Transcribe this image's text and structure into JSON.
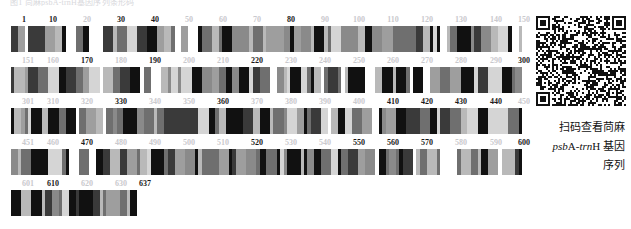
{
  "figure": {
    "top_caption": "图1 苘麻psbA-trnH基因序列条形码",
    "sequence_length": 637,
    "bases_per_row": 150,
    "rows": [
      {
        "start": 1,
        "end": 150,
        "ticks": [
          {
            "value": "1",
            "pos": 1,
            "bold": true
          },
          {
            "value": "10",
            "pos": 10,
            "bold": true
          },
          {
            "value": "20",
            "pos": 20,
            "bold": false
          },
          {
            "value": "30",
            "pos": 30,
            "bold": true
          },
          {
            "value": "40",
            "pos": 40,
            "bold": true
          },
          {
            "value": "50",
            "pos": 50,
            "bold": false
          },
          {
            "value": "60",
            "pos": 60,
            "bold": false
          },
          {
            "value": "70",
            "pos": 70,
            "bold": false
          },
          {
            "value": "80",
            "pos": 80,
            "bold": true
          },
          {
            "value": "90",
            "pos": 90,
            "bold": false
          },
          {
            "value": "100",
            "pos": 100,
            "bold": false
          },
          {
            "value": "110",
            "pos": 110,
            "bold": false
          },
          {
            "value": "120",
            "pos": 120,
            "bold": false
          },
          {
            "value": "130",
            "pos": 130,
            "bold": false
          },
          {
            "value": "140",
            "pos": 140,
            "bold": false
          },
          {
            "value": "150",
            "pos": 150,
            "bold": false
          }
        ]
      },
      {
        "start": 151,
        "end": 300,
        "ticks": [
          {
            "value": "151",
            "pos": 151,
            "bold": false
          },
          {
            "value": "160",
            "pos": 160,
            "bold": false
          },
          {
            "value": "170",
            "pos": 170,
            "bold": true
          },
          {
            "value": "180",
            "pos": 180,
            "bold": false
          },
          {
            "value": "190",
            "pos": 190,
            "bold": true
          },
          {
            "value": "200",
            "pos": 200,
            "bold": false
          },
          {
            "value": "210",
            "pos": 210,
            "bold": false
          },
          {
            "value": "220",
            "pos": 220,
            "bold": true
          },
          {
            "value": "230",
            "pos": 230,
            "bold": false
          },
          {
            "value": "240",
            "pos": 240,
            "bold": false
          },
          {
            "value": "250",
            "pos": 250,
            "bold": false
          },
          {
            "value": "260",
            "pos": 260,
            "bold": false
          },
          {
            "value": "270",
            "pos": 270,
            "bold": false
          },
          {
            "value": "280",
            "pos": 280,
            "bold": false
          },
          {
            "value": "290",
            "pos": 290,
            "bold": false
          },
          {
            "value": "300",
            "pos": 300,
            "bold": true
          }
        ]
      },
      {
        "start": 301,
        "end": 450,
        "ticks": [
          {
            "value": "301",
            "pos": 301,
            "bold": false
          },
          {
            "value": "310",
            "pos": 310,
            "bold": false
          },
          {
            "value": "320",
            "pos": 320,
            "bold": false
          },
          {
            "value": "330",
            "pos": 330,
            "bold": true
          },
          {
            "value": "340",
            "pos": 340,
            "bold": false
          },
          {
            "value": "350",
            "pos": 350,
            "bold": false
          },
          {
            "value": "360",
            "pos": 360,
            "bold": true
          },
          {
            "value": "370",
            "pos": 370,
            "bold": false
          },
          {
            "value": "380",
            "pos": 380,
            "bold": false
          },
          {
            "value": "390",
            "pos": 390,
            "bold": false
          },
          {
            "value": "400",
            "pos": 400,
            "bold": false
          },
          {
            "value": "410",
            "pos": 410,
            "bold": true
          },
          {
            "value": "420",
            "pos": 420,
            "bold": true
          },
          {
            "value": "430",
            "pos": 430,
            "bold": true
          },
          {
            "value": "440",
            "pos": 440,
            "bold": true
          },
          {
            "value": "450",
            "pos": 450,
            "bold": false
          }
        ]
      },
      {
        "start": 451,
        "end": 600,
        "ticks": [
          {
            "value": "451",
            "pos": 451,
            "bold": false
          },
          {
            "value": "460",
            "pos": 460,
            "bold": false
          },
          {
            "value": "470",
            "pos": 470,
            "bold": true
          },
          {
            "value": "480",
            "pos": 480,
            "bold": false
          },
          {
            "value": "490",
            "pos": 490,
            "bold": false
          },
          {
            "value": "500",
            "pos": 500,
            "bold": false
          },
          {
            "value": "510",
            "pos": 510,
            "bold": false
          },
          {
            "value": "520",
            "pos": 520,
            "bold": true
          },
          {
            "value": "530",
            "pos": 530,
            "bold": false
          },
          {
            "value": "540",
            "pos": 540,
            "bold": false
          },
          {
            "value": "550",
            "pos": 550,
            "bold": true
          },
          {
            "value": "560",
            "pos": 560,
            "bold": true
          },
          {
            "value": "570",
            "pos": 570,
            "bold": true
          },
          {
            "value": "580",
            "pos": 580,
            "bold": false
          },
          {
            "value": "590",
            "pos": 590,
            "bold": false
          },
          {
            "value": "600",
            "pos": 600,
            "bold": true
          }
        ]
      },
      {
        "start": 601,
        "end": 637,
        "ticks": [
          {
            "value": "601",
            "pos": 601,
            "bold": false
          },
          {
            "value": "610",
            "pos": 610,
            "bold": true
          },
          {
            "value": "620",
            "pos": 620,
            "bold": false
          },
          {
            "value": "630",
            "pos": 630,
            "bold": false
          },
          {
            "value": "637",
            "pos": 637,
            "bold": true
          }
        ]
      }
    ]
  },
  "qr": {
    "icon": "qr-code-icon",
    "alt": "QR code"
  },
  "side_note": {
    "line1": "扫码查看苘麻",
    "line2_pre": "psb",
    "line2_mid": "A-",
    "line2_it": "trn",
    "line2_post": "H 基因",
    "line3": "序列"
  },
  "colors": {
    "bar_dark": "#111111",
    "bar_mid": "#6f6f6f",
    "bar_light": "#b9b9b9",
    "tick_strong": "#1a1a1a",
    "tick_weak": "#c9c9cd",
    "background": "#ffffff"
  }
}
